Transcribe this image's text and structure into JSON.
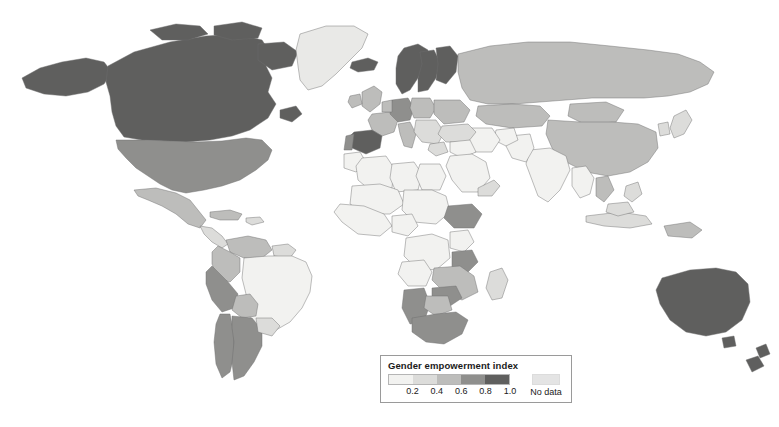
{
  "figure": {
    "kind": "world-choropleth-map",
    "background_color": "#ffffff",
    "width": 779,
    "height": 427
  },
  "legend": {
    "title": "Gender empowerment index",
    "tick_labels": [
      "0.2",
      "0.4",
      "0.6",
      "0.8",
      "1.0"
    ],
    "tick_positions_pct": [
      20,
      40,
      60,
      80,
      100
    ],
    "bin_colors": [
      "#f2f2f0",
      "#dcdcda",
      "#bdbdbb",
      "#8f8f8d",
      "#5f5f5e"
    ],
    "nodata_label": "No data",
    "nodata_color": "#e4e4e4",
    "border_color": "#9a9a9a"
  },
  "chart_data": {
    "type": "heatmap",
    "title": "Gender empowerment index",
    "xlabel": "",
    "ylabel": "",
    "legend_position": "bottom-center",
    "grid": false,
    "value_range": [
      0.0,
      1.0
    ],
    "bins": [
      {
        "label": "0.0-0.2",
        "color": "#f2f2f0"
      },
      {
        "label": "0.2-0.4",
        "color": "#dcdcda"
      },
      {
        "label": "0.4-0.6",
        "color": "#bdbdbb"
      },
      {
        "label": "0.6-0.8",
        "color": "#8f8f8d"
      },
      {
        "label": "0.8-1.0",
        "color": "#5f5f5e"
      },
      {
        "label": "No data",
        "color": "#e4e4e4"
      }
    ],
    "regions": [
      {
        "name": "Canada",
        "bin": "0.8-1.0",
        "value": 0.9
      },
      {
        "name": "United States",
        "bin": "0.6-0.8",
        "value": 0.7
      },
      {
        "name": "Greenland",
        "bin": "No data",
        "value": null
      },
      {
        "name": "Mexico",
        "bin": "0.4-0.6",
        "value": 0.5
      },
      {
        "name": "Central America",
        "bin": "0.2-0.4",
        "value": 0.3
      },
      {
        "name": "Cuba",
        "bin": "0.4-0.6",
        "value": 0.5
      },
      {
        "name": "Colombia",
        "bin": "0.4-0.6",
        "value": 0.5
      },
      {
        "name": "Venezuela",
        "bin": "0.4-0.6",
        "value": 0.5
      },
      {
        "name": "Brazil",
        "bin": "0.0-0.2",
        "value": 0.15
      },
      {
        "name": "Peru",
        "bin": "0.6-0.8",
        "value": 0.7
      },
      {
        "name": "Bolivia",
        "bin": "0.4-0.6",
        "value": 0.5
      },
      {
        "name": "Chile",
        "bin": "0.6-0.8",
        "value": 0.7
      },
      {
        "name": "Argentina",
        "bin": "0.6-0.8",
        "value": 0.7
      },
      {
        "name": "Iceland",
        "bin": "0.8-1.0",
        "value": 0.9
      },
      {
        "name": "Norway",
        "bin": "0.8-1.0",
        "value": 0.95
      },
      {
        "name": "Sweden",
        "bin": "0.8-1.0",
        "value": 0.95
      },
      {
        "name": "Finland",
        "bin": "0.8-1.0",
        "value": 0.92
      },
      {
        "name": "United Kingdom",
        "bin": "0.4-0.6",
        "value": 0.55
      },
      {
        "name": "Ireland",
        "bin": "0.4-0.6",
        "value": 0.55
      },
      {
        "name": "France",
        "bin": "0.4-0.6",
        "value": 0.55
      },
      {
        "name": "Spain",
        "bin": "0.8-1.0",
        "value": 0.85
      },
      {
        "name": "Portugal",
        "bin": "0.6-0.8",
        "value": 0.7
      },
      {
        "name": "Germany",
        "bin": "0.6-0.8",
        "value": 0.75
      },
      {
        "name": "Poland",
        "bin": "0.4-0.6",
        "value": 0.5
      },
      {
        "name": "Italy",
        "bin": "0.4-0.6",
        "value": 0.5
      },
      {
        "name": "Russia",
        "bin": "0.4-0.6",
        "value": 0.5
      },
      {
        "name": "Kazakhstan",
        "bin": "0.4-0.6",
        "value": 0.5
      },
      {
        "name": "Mongolia",
        "bin": "0.4-0.6",
        "value": 0.5
      },
      {
        "name": "China",
        "bin": "0.4-0.6",
        "value": 0.5
      },
      {
        "name": "India",
        "bin": "0.0-0.2",
        "value": 0.15
      },
      {
        "name": "Pakistan",
        "bin": "0.0-0.2",
        "value": 0.12
      },
      {
        "name": "Saudi Arabia",
        "bin": "0.0-0.2",
        "value": 0.1
      },
      {
        "name": "Iran",
        "bin": "0.0-0.2",
        "value": 0.15
      },
      {
        "name": "Turkey",
        "bin": "0.2-0.4",
        "value": 0.3
      },
      {
        "name": "Japan",
        "bin": "0.4-0.6",
        "value": 0.5
      },
      {
        "name": "Indonesia",
        "bin": "0.2-0.4",
        "value": 0.3
      },
      {
        "name": "North Africa",
        "bin": "0.0-0.2",
        "value": 0.12
      },
      {
        "name": "West Africa",
        "bin": "0.0-0.2",
        "value": 0.12
      },
      {
        "name": "Ethiopia",
        "bin": "0.4-0.6",
        "value": 0.5
      },
      {
        "name": "Tanzania",
        "bin": "0.4-0.6",
        "value": 0.5
      },
      {
        "name": "Namibia",
        "bin": "0.6-0.8",
        "value": 0.7
      },
      {
        "name": "Botswana",
        "bin": "0.4-0.6",
        "value": 0.5
      },
      {
        "name": "South Africa",
        "bin": "0.6-0.8",
        "value": 0.7
      },
      {
        "name": "Zimbabwe",
        "bin": "0.4-0.6",
        "value": 0.5
      },
      {
        "name": "Madagascar",
        "bin": "0.2-0.4",
        "value": 0.3
      },
      {
        "name": "Australia",
        "bin": "0.8-1.0",
        "value": 0.95
      },
      {
        "name": "New Zealand",
        "bin": "0.8-1.0",
        "value": 0.93
      }
    ]
  }
}
